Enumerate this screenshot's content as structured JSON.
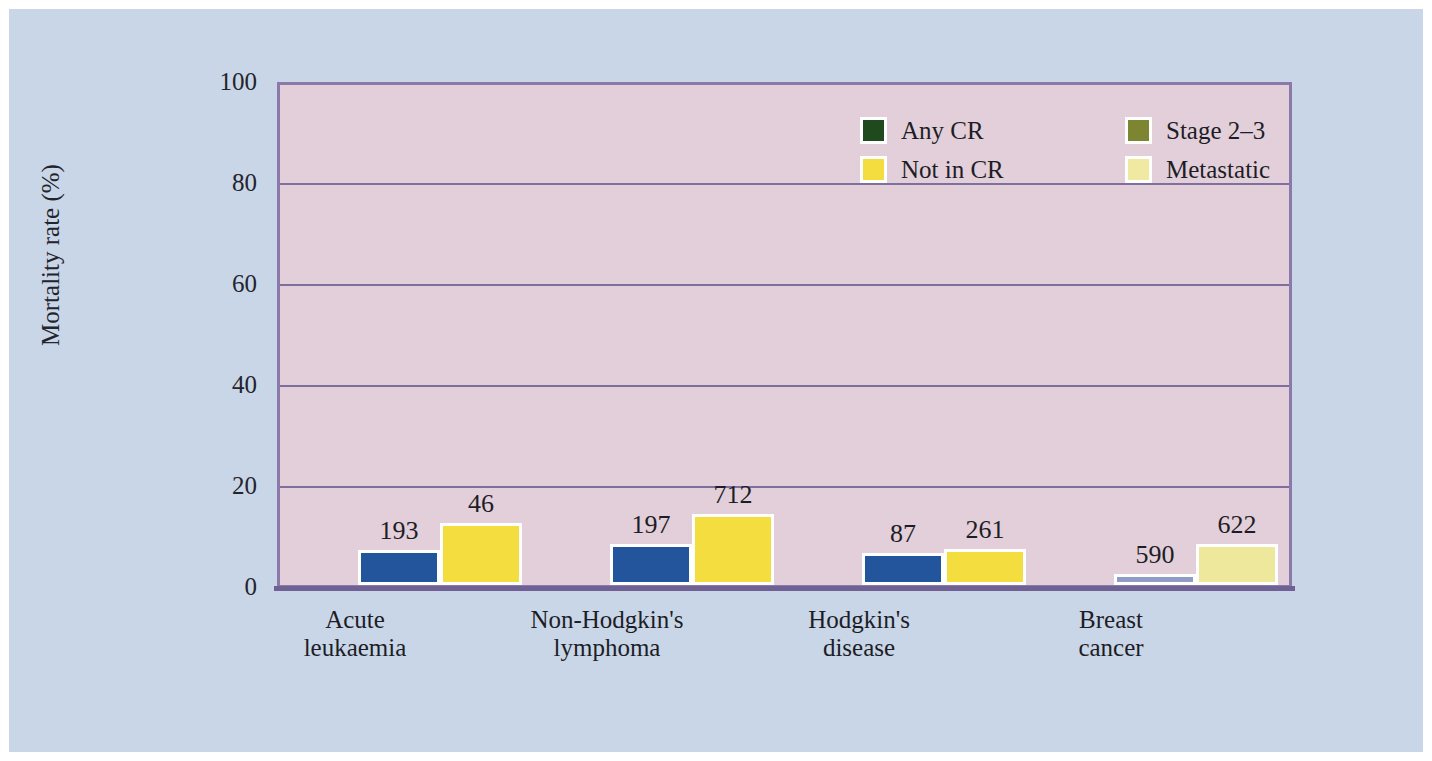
{
  "chart_data": {
    "type": "bar",
    "title": "",
    "xlabel": "",
    "ylabel": "Mortality rate (%)",
    "ylim": [
      0,
      100
    ],
    "yticks": [
      "0",
      "20",
      "40",
      "60",
      "80",
      "100"
    ],
    "grid": true,
    "legend_position": "top-right",
    "categories": [
      "Acute leukaemia",
      "Non-Hodgkin's lymphoma",
      "Hodgkin's disease",
      "Breast cancer"
    ],
    "category_lines": [
      [
        "Acute",
        "leukaemia"
      ],
      [
        "Non-Hodgkin's",
        "lymphoma"
      ],
      [
        "Hodgkin's",
        "disease"
      ],
      [
        "Breast",
        "cancer"
      ]
    ],
    "legend": [
      {
        "label": "Any CR",
        "color": "#1f4a1e"
      },
      {
        "label": "Stage 2–3",
        "color": "#7d8533"
      },
      {
        "label": "Not in CR",
        "color": "#f4dd3f"
      },
      {
        "label": "Metastatic",
        "color": "#efe9a2"
      }
    ],
    "series": [
      {
        "name": "Any CR / Stage 2-3",
        "values": [
          7.1,
          8.2,
          6.5,
          2.3
        ],
        "point_labels": [
          "193",
          "197",
          "87",
          "590"
        ],
        "colors": [
          "#23559c",
          "#23559c",
          "#23559c",
          "#8e9cc6"
        ]
      },
      {
        "name": "Not in CR / Metastatic",
        "values": [
          12.5,
          14.2,
          7.3,
          8.2
        ],
        "point_labels": [
          "46",
          "712",
          "261",
          "622"
        ],
        "colors": [
          "#f4dd3f",
          "#f4dd3f",
          "#f4dd3f",
          "#eee89c"
        ]
      }
    ]
  },
  "colors": {
    "page": "#ffffff",
    "figure_background": "#c8d6e8",
    "plot_background": "#e2cfd9",
    "plot_border": "#8a79a9",
    "gridline": "#7e6f9e",
    "axis": "#6f6194",
    "text": "#1d1d26"
  }
}
